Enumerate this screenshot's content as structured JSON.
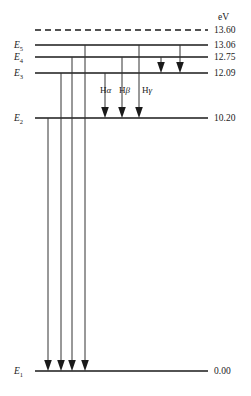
{
  "diagram": {
    "unit_header": "eV",
    "levels": [
      {
        "id": "ionization",
        "label": "",
        "sublabel": "",
        "energy": "13.60",
        "style": "dashed",
        "y": 30,
        "x_start": 35,
        "x_end": 208
      },
      {
        "id": "E5",
        "label": "E",
        "sublabel": "5",
        "energy": "13.06",
        "style": "solid",
        "y": 45,
        "x_start": 35,
        "x_end": 208
      },
      {
        "id": "E4",
        "label": "E",
        "sublabel": "4",
        "energy": "12.75",
        "style": "solid",
        "y": 57,
        "x_start": 35,
        "x_end": 208
      },
      {
        "id": "E3",
        "label": "E",
        "sublabel": "3",
        "energy": "12.09",
        "style": "solid",
        "y": 73,
        "x_start": 35,
        "x_end": 208
      },
      {
        "id": "E2",
        "label": "E",
        "sublabel": "2",
        "energy": "10.20",
        "style": "solid",
        "y": 118,
        "x_start": 35,
        "x_end": 208
      },
      {
        "id": "E1",
        "label": "E",
        "sublabel": "1",
        "energy": "0.00",
        "style": "solid",
        "y": 371,
        "x_start": 35,
        "x_end": 208
      }
    ],
    "series_labels": [
      {
        "id": "h-alpha",
        "prefix": "H",
        "greek": "α",
        "x": 100,
        "y": 93
      },
      {
        "id": "h-beta",
        "prefix": "H",
        "greek": "β",
        "x": 119,
        "y": 93
      },
      {
        "id": "h-gamma",
        "prefix": "H",
        "greek": "γ",
        "x": 142,
        "y": 93
      }
    ],
    "transitions": [
      {
        "id": "lyman-2-1",
        "series": "Lyman",
        "from": "E2",
        "to": "E1",
        "x": 48,
        "y_start": 118,
        "y_end": 369
      },
      {
        "id": "lyman-3-1",
        "series": "Lyman",
        "from": "E3",
        "to": "E1",
        "x": 61,
        "y_start": 73,
        "y_end": 369
      },
      {
        "id": "lyman-4-1",
        "series": "Lyman",
        "from": "E4",
        "to": "E1",
        "x": 72,
        "y_start": 57,
        "y_end": 369
      },
      {
        "id": "lyman-5-1",
        "series": "Lyman",
        "from": "E5",
        "to": "E1",
        "x": 85,
        "y_start": 45,
        "y_end": 369
      },
      {
        "id": "balmer-3-2",
        "series": "Balmer",
        "from": "E3",
        "to": "E2",
        "x": 105,
        "y_start": 73,
        "y_end": 116
      },
      {
        "id": "balmer-4-2",
        "series": "Balmer",
        "from": "E4",
        "to": "E2",
        "x": 122,
        "y_start": 57,
        "y_end": 116
      },
      {
        "id": "balmer-5-2",
        "series": "Balmer",
        "from": "E5",
        "to": "E2",
        "x": 139,
        "y_start": 45,
        "y_end": 116
      },
      {
        "id": "paschen-4-3",
        "series": "Paschen",
        "from": "E4",
        "to": "E3",
        "x": 161,
        "y_start": 57,
        "y_end": 71
      },
      {
        "id": "paschen-5-3",
        "series": "Paschen",
        "from": "E5",
        "to": "E3",
        "x": 180,
        "y_start": 45,
        "y_end": 71
      }
    ],
    "colors": {
      "line": "#1a1a1a",
      "transition": "#333333",
      "background": "#ffffff"
    }
  }
}
